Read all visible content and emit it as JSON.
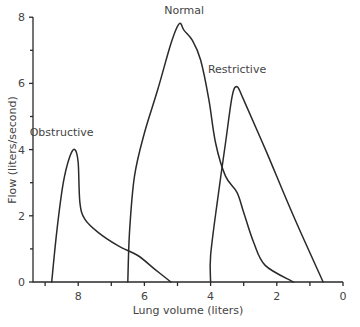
{
  "chart_data": {
    "type": "line",
    "title": "",
    "xlabel": "Lung volume (liters)",
    "ylabel": "Flow (liters/second)",
    "xlim": [
      9.5,
      0
    ],
    "ylim": [
      0,
      8
    ],
    "x_reversed": true,
    "x_ticks": [
      8,
      6,
      4,
      2,
      0
    ],
    "x_minor_ticks": [
      9,
      7,
      5,
      3,
      1
    ],
    "y_ticks": [
      0,
      2,
      4,
      6,
      8
    ],
    "y_minor_ticks": [
      1,
      3,
      5,
      7
    ],
    "grid": false,
    "legend": "inline labels",
    "series": [
      {
        "name": "Obstructive",
        "label_pos": {
          "x": 8.5,
          "y": 4.4
        },
        "points": [
          [
            8.8,
            0
          ],
          [
            8.65,
            1.5
          ],
          [
            8.45,
            3.0
          ],
          [
            8.25,
            3.8
          ],
          [
            8.1,
            4.0
          ],
          [
            8.0,
            3.6
          ],
          [
            7.95,
            2.4
          ],
          [
            7.8,
            1.9
          ],
          [
            7.4,
            1.5
          ],
          [
            6.8,
            1.1
          ],
          [
            6.2,
            0.8
          ],
          [
            5.7,
            0.4
          ],
          [
            5.2,
            0
          ]
        ]
      },
      {
        "name": "Normal",
        "label_pos": {
          "x": 4.8,
          "y": 8.1
        },
        "points": [
          [
            6.5,
            0
          ],
          [
            6.45,
            1.5
          ],
          [
            6.3,
            3.2
          ],
          [
            6.0,
            4.5
          ],
          [
            5.6,
            5.8
          ],
          [
            5.2,
            7.2
          ],
          [
            4.95,
            7.8
          ],
          [
            4.8,
            7.6
          ],
          [
            4.55,
            7.3
          ],
          [
            4.3,
            6.7
          ],
          [
            4.05,
            5.5
          ],
          [
            3.85,
            4.2
          ],
          [
            3.55,
            3.2
          ],
          [
            3.2,
            2.7
          ],
          [
            3.0,
            2.1
          ],
          [
            2.7,
            1.2
          ],
          [
            2.35,
            0.5
          ],
          [
            1.5,
            0
          ]
        ]
      },
      {
        "name": "Restrictive",
        "label_pos": {
          "x": 3.2,
          "y": 6.3
        },
        "points": [
          [
            4.0,
            0
          ],
          [
            4.0,
            0.8
          ],
          [
            3.8,
            2.4
          ],
          [
            3.55,
            4.2
          ],
          [
            3.35,
            5.6
          ],
          [
            3.2,
            5.9
          ],
          [
            3.0,
            5.5
          ],
          [
            2.3,
            3.9
          ],
          [
            1.5,
            2.0
          ],
          [
            0.6,
            0
          ]
        ]
      }
    ]
  },
  "layout": {
    "plot": {
      "left": 33,
      "right": 343,
      "top": 17,
      "bottom": 282
    },
    "x0_px": 343,
    "px_per_liter": 33.1,
    "y0_px": 282,
    "px_per_lps": 33.1
  },
  "colors": {
    "line": "#2a2a2a",
    "text": "#444444",
    "background": "#ffffff"
  }
}
